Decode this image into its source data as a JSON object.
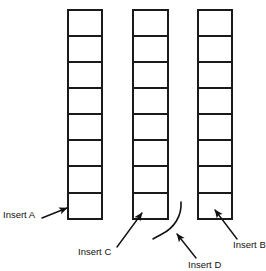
{
  "figure": {
    "background_color": "#ffffff",
    "stroke_color": "#1a1a1a",
    "text_color": "#111111",
    "columns": [
      {
        "id": "column-left",
        "cells": 8,
        "x": 68,
        "y": 10,
        "width": 34,
        "height": 209
      },
      {
        "id": "column-middle",
        "cells": 8,
        "x": 133,
        "y": 10,
        "width": 35,
        "height": 209
      },
      {
        "id": "column-right",
        "cells": 8,
        "x": 198,
        "y": 10,
        "width": 34,
        "height": 209
      }
    ],
    "annotations": [
      {
        "id": "insert-a",
        "label": "Insert A",
        "label_x": 3,
        "label_y": 215,
        "leader": "M 42 218 L 69 208",
        "arrow_at": "column-left-bottom-cell"
      },
      {
        "id": "insert-c",
        "label": "Insert C",
        "label_x": 78,
        "label_y": 252,
        "leader": "M 117 247 L 143 212",
        "arrow_at": "column-middle-bottom-cell"
      },
      {
        "id": "insert-d",
        "label": "Insert D",
        "label_x": 188,
        "label_y": 265,
        "leader": "M 196 258 L 176 233",
        "arrow_at": "curve-mark"
      },
      {
        "id": "insert-b",
        "label": "Insert B",
        "label_x": 233,
        "label_y": 245,
        "leader": "M 237 239 L 214 209",
        "arrow_at": "column-right-bottom-cell"
      }
    ],
    "curve": {
      "id": "gap-curve",
      "path": "M 181 202 C 182 216 174 228 162 234 C 158 236 155 238 153 239"
    }
  }
}
